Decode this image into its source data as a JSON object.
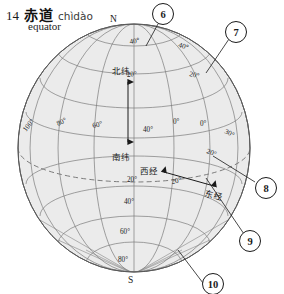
{
  "entry": {
    "number": "14",
    "hanzi": "赤道",
    "pinyin": "chìdào",
    "gloss": "equator"
  },
  "diagram": {
    "poles": {
      "north": "N",
      "south": "S"
    },
    "annotations": {
      "north_latitude": "北纬",
      "south_latitude": "南纬",
      "west_longitude": "西经",
      "east_longitude": "东经"
    },
    "latitude_labels_left": [
      "100°",
      "80°",
      "60°"
    ],
    "latitude_labels_north": [
      "40°",
      "20°"
    ],
    "latitude_labels_equator": [
      "0°",
      "40°"
    ],
    "latitude_labels_south": [
      "20°",
      "40°",
      "60°",
      "80°"
    ],
    "longitude_labels_right": [
      "0°",
      "20°",
      "20°",
      "30°"
    ],
    "callouts": [
      {
        "id": "6",
        "label": "6"
      },
      {
        "id": "7",
        "label": "7"
      },
      {
        "id": "8",
        "label": "8"
      },
      {
        "id": "9",
        "label": "9"
      },
      {
        "id": "10",
        "label": "10"
      }
    ],
    "colors": {
      "globe_fill": "#ebebeb",
      "grid_line": "#7b7b7b",
      "outline": "#5a5a5a",
      "equator_dash": "#6f6f6f",
      "callout_stroke": "#1a1a1a"
    }
  }
}
